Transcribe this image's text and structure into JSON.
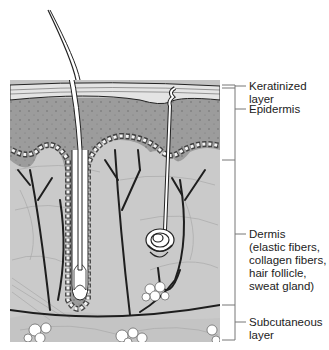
{
  "figure": {
    "colors": {
      "epidermis": "#9a9a9a",
      "dermis": "#c9c9c9",
      "subcutaneous": "#c2c2c2",
      "keratinized": "#e6e6e6",
      "outline": "#222222",
      "fat_cells": "#ffffff"
    }
  },
  "labels": {
    "keratinized": "Keratinized\nlayer",
    "epidermis": "Epidermis",
    "dermis": "Dermis\n(elastic fibers,\ncollagen fibers,\nhair follicle,\nsweat gland)",
    "subcutaneous": "Subcutaneous\nlayer"
  },
  "structures": [
    "hair shaft",
    "hair follicle",
    "sweat gland",
    "sweat duct",
    "blood vessels",
    "fat cells",
    "collagen fibers"
  ]
}
